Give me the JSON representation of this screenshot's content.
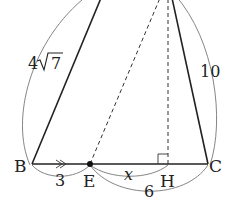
{
  "diagram": {
    "type": "triangle-geometry",
    "points": {
      "B": {
        "label": "B",
        "x": 32,
        "y": 164
      },
      "E": {
        "label": "E",
        "x": 90,
        "y": 164
      },
      "H": {
        "label": "H",
        "x": 168,
        "y": 164
      },
      "C": {
        "label": "C",
        "x": 208,
        "y": 164
      }
    },
    "lengths": {
      "AB": "4√7",
      "AB_coef": "4",
      "AB_rad": "7",
      "AC": "10",
      "BE": "3",
      "EH": "x",
      "EC": "6"
    },
    "markers": {
      "right_angle_at": "H",
      "parallel_arrow_on": "BE"
    },
    "colors": {
      "line": "#222222",
      "arc": "#555555"
    }
  }
}
